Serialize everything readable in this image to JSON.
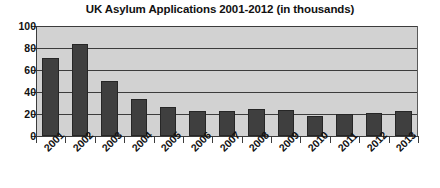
{
  "chart_data": {
    "type": "bar",
    "title": "UK Asylum Applications 2001-2012 (in thousands)",
    "xlabel": "",
    "ylabel": "",
    "ylim": [
      0,
      100
    ],
    "yticks": [
      0,
      20,
      40,
      60,
      80,
      100
    ],
    "ytick_labels": [
      "0",
      "20",
      "40",
      "60",
      "80",
      "100"
    ],
    "grid": true,
    "legend": false,
    "categories": [
      "2001",
      "2002",
      "2003",
      "2004",
      "2005",
      "2006",
      "2007",
      "2008",
      "2009",
      "2010",
      "2011",
      "2012",
      "2013"
    ],
    "values": [
      71,
      84,
      50,
      34,
      26,
      23,
      23,
      25,
      24,
      18,
      20,
      21,
      23
    ],
    "series": [
      {
        "name": "UK Asylum Applications",
        "values": [
          71,
          84,
          50,
          34,
          26,
          23,
          23,
          25,
          24,
          18,
          20,
          21,
          23
        ]
      }
    ],
    "colors": {
      "bar_fill": "#3f3f3f",
      "bar_outline": "#262626",
      "plot_background": "#d2d2d2",
      "gridline": "#3c3c3c",
      "axis": "#3c3c3c",
      "text": "#111111",
      "page_background": "#ffffff"
    }
  }
}
